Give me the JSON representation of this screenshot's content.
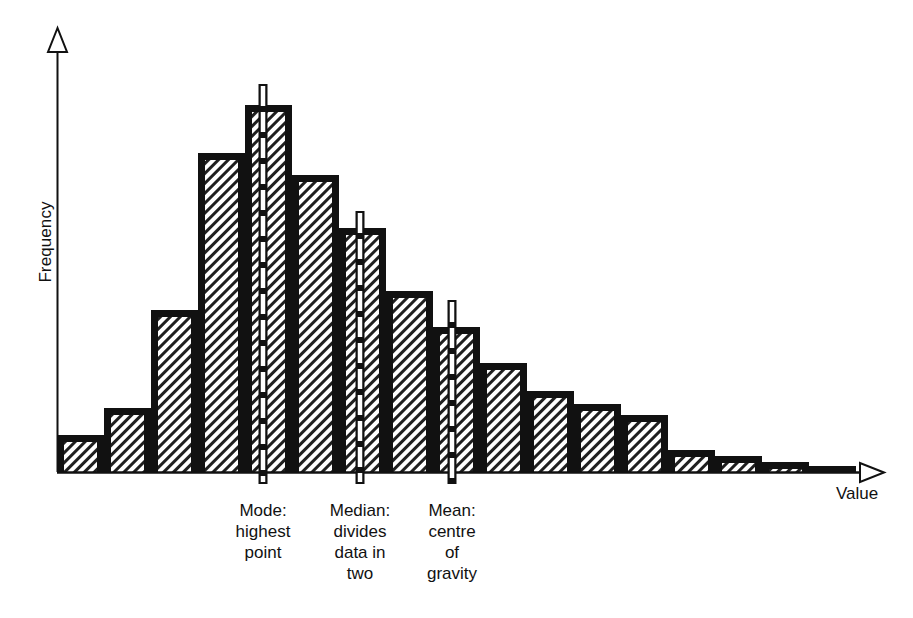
{
  "figure": {
    "type": "histogram-diagram",
    "background": "#ffffff",
    "ink_color": "#111111",
    "hatch_color": "#1a1a1a"
  },
  "axes": {
    "y_title": "Frequency",
    "x_title": "Value",
    "y_arrow": "open-triangle-up",
    "x_arrow": "open-triangle-right",
    "baseline_y": 472,
    "origin_x": 57,
    "axis_end_x": 880,
    "axis_top_y": 30
  },
  "annotations": [
    {
      "id": "mode",
      "marker_x": 263,
      "title": "Mode:",
      "lines": [
        "Mode:",
        "highest",
        "point"
      ],
      "label_left": 213,
      "label_top": 500,
      "marker_top_y": 84,
      "marker_bottom_y": 484
    },
    {
      "id": "median",
      "marker_x": 360,
      "title": "Median:",
      "lines": [
        "Median:",
        "divides",
        "data in",
        "two"
      ],
      "label_left": 310,
      "label_top": 500,
      "marker_top_y": 211,
      "marker_bottom_y": 484
    },
    {
      "id": "mean",
      "marker_x": 452,
      "title": "Mean:",
      "lines": [
        "Mean:",
        "centre",
        "of",
        "gravity"
      ],
      "label_left": 402,
      "label_top": 500,
      "marker_top_y": 300,
      "marker_bottom_y": 484
    }
  ],
  "chart_data": {
    "type": "bar",
    "title": "",
    "subtitle": "",
    "xlabel": "Value",
    "ylabel": "Frequency",
    "grid": false,
    "legend": "none",
    "axis_ticks": "none",
    "distribution": "right-skewed (positively skewed) unimodal",
    "bar_count": 17,
    "bar_width_px": 47,
    "first_bar_left_px": 57,
    "baseline_px": 472,
    "categories": [
      "1",
      "2",
      "3",
      "4",
      "5",
      "6",
      "7",
      "8",
      "9",
      "10",
      "11",
      "12",
      "13",
      "14",
      "15",
      "16",
      "17"
    ],
    "values": [
      9,
      16,
      46,
      76,
      90,
      75,
      62,
      52,
      42,
      33,
      27,
      23,
      20,
      8,
      6,
      4,
      2
    ],
    "bar_tops_px": [
      435,
      408,
      310,
      153,
      105,
      175,
      228,
      291,
      327,
      363,
      391,
      404,
      415,
      450,
      456,
      462,
      466
    ],
    "ylim": [
      0,
      95
    ]
  }
}
